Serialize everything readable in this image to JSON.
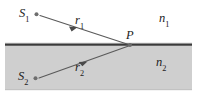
{
  "figure": {
    "kind": "optics-refraction-diagram",
    "width": 204,
    "height": 97,
    "background_color": "#ffffff",
    "medium_fill_color": "#cfcfcf",
    "interface_line_color": "#3a3a3a",
    "ray_color": "#5a5a5a",
    "source_dot_color": "#6e6e6e",
    "label_color": "#1b1b1b"
  },
  "labels": {
    "source1": "S",
    "source1_sub": "1",
    "source2": "S",
    "source2_sub": "2",
    "ray1": "r",
    "ray1_sub": "1",
    "ray2": "r",
    "ray2_sub": "2",
    "point_p": "P",
    "index1": "n",
    "index1_sub": "1",
    "index2": "n",
    "index2_sub": "2"
  },
  "geometry": {
    "interface_y": 45,
    "interface_x_start": 5,
    "interface_x_end": 192,
    "medium2_top": 46,
    "medium2_bottom": 90,
    "point_p": {
      "x": 130,
      "y": 45
    },
    "source1_dot": {
      "x": 36,
      "y": 14
    },
    "source2_dot": {
      "x": 35,
      "y": 78
    },
    "ray1_arrow_at": {
      "x": 72,
      "y": 28
    },
    "ray2_arrow_at": {
      "x": 81,
      "y": 60
    }
  }
}
